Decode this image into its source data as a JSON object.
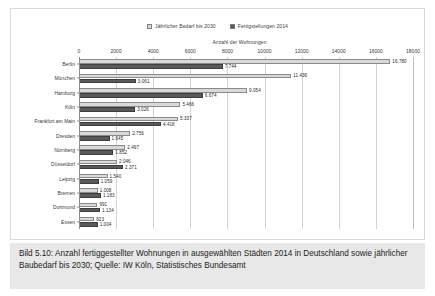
{
  "chart_data": {
    "type": "bar",
    "orientation": "horizontal",
    "title": "",
    "xlabel": "Anzahl der Wohnungen",
    "ylabel": "",
    "xlim": [
      0,
      18000
    ],
    "xticks": [
      0,
      2000,
      4000,
      6000,
      8000,
      10000,
      12000,
      14000,
      16000,
      18000
    ],
    "xtick_labels": [
      "0",
      "2000",
      "4000",
      "6000",
      "8000",
      "10000",
      "12000",
      "14000",
      "16000",
      "18000"
    ],
    "grid": true,
    "legend_position": "top-center",
    "categories": [
      "Berlin",
      "München",
      "Hamburg",
      "Köln",
      "Frankfurt am Main",
      "Dresden",
      "Nürnberg",
      "Düsseldorf",
      "Leipzig",
      "Bremen",
      "Dortmund",
      "Essen"
    ],
    "series": [
      {
        "name": "Jährlicher Bedarf bis 2030",
        "color": "#d9d9d9",
        "values": [
          16780,
          11436,
          9054,
          5466,
          5337,
          2756,
          2497,
          2046,
          1540,
          1008,
          991,
          823
        ],
        "labels": [
          "16.780",
          "11.436",
          "9.054",
          "5.466",
          "5.337",
          "2.756",
          "2.497",
          "2.046",
          "1.540",
          "1.008",
          "991",
          "823"
        ]
      },
      {
        "name": "Fertigstellungen 2014",
        "color": "#595959",
        "values": [
          7744,
          3061,
          6674,
          3026,
          4418,
          1645,
          1852,
          2371,
          1059,
          1183,
          1134,
          1004
        ],
        "labels": [
          "7.744",
          "3.061",
          "6.674",
          "3.026",
          "4.418",
          "1.645",
          "1.852",
          "2.371",
          "1.059",
          "1.183",
          "1.134",
          "1.004"
        ]
      }
    ]
  },
  "caption": {
    "text": "Bild 5.10: Anzahl fertiggestellter Wohnungen in ausgewählten Städten 2014 in Deutschland sowie jährlicher Baubedarf bis 2030; Quelle: IW Köln, Statistisches Bundesamt"
  }
}
